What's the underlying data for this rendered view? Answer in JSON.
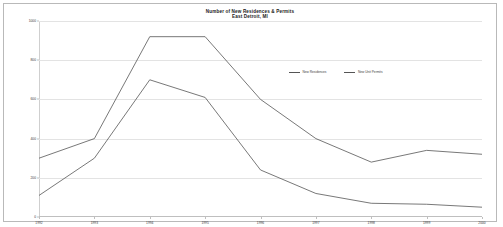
{
  "chart_data": {
    "type": "line",
    "title": "Number of New Residences & Permits",
    "subtitle": "East Detroit, MI",
    "xlabel": "",
    "ylabel": "",
    "grid": true,
    "legend_position": "center-right",
    "ylim": [
      0,
      1000
    ],
    "yticks": [
      0,
      200,
      400,
      600,
      800,
      1000
    ],
    "ytick_labels": [
      "0",
      "200",
      "400",
      "600",
      "800",
      "1000"
    ],
    "categories": [
      "1992",
      "1993",
      "1994",
      "1995",
      "1996",
      "1997",
      "1998",
      "1999",
      "2000"
    ],
    "series": [
      {
        "name": "New Residences",
        "color": "#555555",
        "values": [
          300,
          400,
          920,
          920,
          600,
          400,
          280,
          340,
          320
        ]
      },
      {
        "name": "New Unit Permits",
        "color": "#555555",
        "values": [
          110,
          300,
          700,
          610,
          240,
          120,
          70,
          65,
          50
        ]
      }
    ]
  },
  "legend": {
    "items": [
      {
        "label": "New Residences",
        "color": "#555555"
      },
      {
        "label": "New Unit Permits",
        "color": "#555555"
      }
    ]
  }
}
